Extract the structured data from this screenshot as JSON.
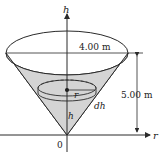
{
  "figure": {
    "axis_vertical_label": "h",
    "axis_horizontal_label": "r",
    "origin_label": "0",
    "top_diameter_label": "4.00 m",
    "height_label": "5.00 m",
    "disk_radius_label": "r",
    "disk_thickness_label": "dh",
    "disk_height_label": "h",
    "colors": {
      "cone_fill": "#d4d4d4",
      "stroke": "#2a2a2a"
    }
  }
}
